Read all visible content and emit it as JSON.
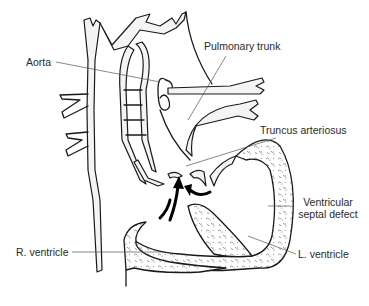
{
  "figure": {
    "labels": {
      "aorta": "Aorta",
      "pulmonary_trunk": "Pulmonary trunk",
      "truncus_arteriosus": "Truncus arteriosus",
      "vsd_line1": "Ventricular",
      "vsd_line2": "septal defect",
      "r_ventricle": "R. ventricle",
      "l_ventricle": "L. ventricle"
    },
    "colors": {
      "background": "#ffffff",
      "outline": "#1a1a1a",
      "leader_line": "#555555",
      "label_text": "#2a2a2a"
    }
  }
}
